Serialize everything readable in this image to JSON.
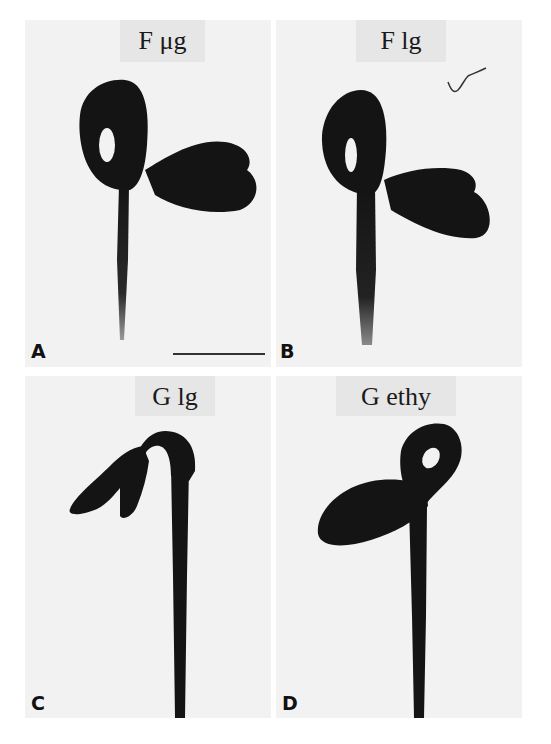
{
  "figure": {
    "panels": [
      {
        "letter": "A",
        "label": "F μg",
        "description": "seedling with closed apical hook, cotyledons open to the right"
      },
      {
        "letter": "B",
        "label": "F lg",
        "description": "seedling with closed apical hook, cotyledons open to the right"
      },
      {
        "letter": "C",
        "label": "G lg",
        "description": "seedling with open apical hook, cotyledons to the left"
      },
      {
        "letter": "D",
        "label": "G ethy",
        "description": "seedling with exaggerated apical hook, cotyledon to the left"
      }
    ],
    "scale_bar": {
      "panel": "A",
      "visible": true
    },
    "colors": {
      "background": "#ffffff",
      "panel_bg": "#f2f2f2",
      "seedling": "#141414",
      "label_bg": "#e6e6e6"
    }
  }
}
